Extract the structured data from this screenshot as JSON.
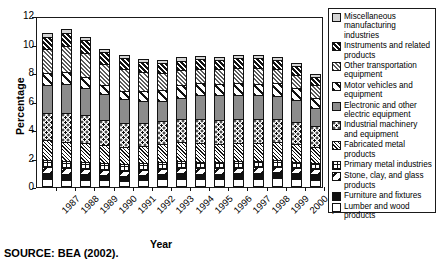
{
  "figure": {
    "source_note": "SOURCE: BEA (2002)."
  },
  "chart_data": {
    "type": "bar",
    "subtype": "stacked-bar",
    "title": "",
    "xlabel": "Year",
    "ylabel": "Percentage",
    "ylim": [
      0,
      12
    ],
    "yticks": [
      "0",
      "2",
      "4",
      "6",
      "8",
      "10",
      "12"
    ],
    "grid": false,
    "legend_position": "right",
    "categories": [
      "1987",
      "1988",
      "1989",
      "1990",
      "1991",
      "1992",
      "1993",
      "1994",
      "1995",
      "1996",
      "1997",
      "1998",
      "1999",
      "2000",
      "2001"
    ],
    "series": [
      {
        "name": "Lumber and wood products",
        "pattern": "white",
        "values": [
          0.55,
          0.52,
          0.5,
          0.47,
          0.45,
          0.5,
          0.54,
          0.57,
          0.54,
          0.55,
          0.56,
          0.58,
          0.6,
          0.55,
          0.52
        ]
      },
      {
        "name": "Furniture and fixtures",
        "pattern": "solid-black",
        "values": [
          0.4,
          0.39,
          0.38,
          0.36,
          0.35,
          0.36,
          0.38,
          0.4,
          0.39,
          0.39,
          0.4,
          0.41,
          0.42,
          0.4,
          0.38
        ]
      },
      {
        "name": "Stone, clay, and glass products",
        "pattern": "backslash",
        "values": [
          0.42,
          0.4,
          0.39,
          0.37,
          0.35,
          0.35,
          0.36,
          0.38,
          0.37,
          0.37,
          0.38,
          0.39,
          0.4,
          0.38,
          0.36
        ]
      },
      {
        "name": "Primary metal industries",
        "pattern": "grid",
        "values": [
          0.55,
          0.54,
          0.52,
          0.5,
          0.47,
          0.46,
          0.47,
          0.48,
          0.48,
          0.47,
          0.47,
          0.46,
          0.45,
          0.44,
          0.4
        ]
      },
      {
        "name": "Fabricated metal products",
        "pattern": "fine-diagonal",
        "values": [
          1.35,
          1.32,
          1.28,
          1.22,
          1.2,
          1.22,
          1.25,
          1.3,
          1.28,
          1.27,
          1.28,
          1.28,
          1.27,
          1.22,
          1.15
        ]
      },
      {
        "name": "Industrial machinery and equipment",
        "pattern": "dots",
        "values": [
          1.95,
          2.05,
          1.95,
          1.8,
          1.65,
          1.6,
          1.6,
          1.65,
          1.7,
          1.65,
          1.65,
          1.63,
          1.6,
          1.55,
          1.45
        ]
      },
      {
        "name": "Electronic and other electric equipment",
        "pattern": "solid-gray",
        "values": [
          1.95,
          2.0,
          1.95,
          1.8,
          1.7,
          1.55,
          1.45,
          1.5,
          1.72,
          1.75,
          1.75,
          1.7,
          1.65,
          1.6,
          1.3
        ]
      },
      {
        "name": "Motor vehicles and equipment",
        "pattern": "white-bold-diagonal",
        "values": [
          0.8,
          0.85,
          0.72,
          0.62,
          0.6,
          0.68,
          0.78,
          0.88,
          0.82,
          0.8,
          0.82,
          0.8,
          0.88,
          0.82,
          0.7
        ]
      },
      {
        "name": "Other transportation equipment",
        "pattern": "gray-diagonal",
        "values": [
          1.7,
          1.8,
          1.72,
          1.52,
          1.5,
          1.35,
          1.2,
          1.05,
          1.0,
          1.0,
          1.05,
          1.1,
          1.0,
          0.9,
          0.88
        ]
      },
      {
        "name": "Instruments and related products",
        "pattern": "black-diagonal",
        "values": [
          0.88,
          0.95,
          0.88,
          0.82,
          0.78,
          0.72,
          0.68,
          0.65,
          0.66,
          0.66,
          0.68,
          0.68,
          0.66,
          0.62,
          0.6
        ]
      },
      {
        "name": "Miscellaneous manufacturing industries",
        "pattern": "light-gray",
        "values": [
          0.25,
          0.26,
          0.25,
          0.24,
          0.22,
          0.22,
          0.22,
          0.23,
          0.23,
          0.23,
          0.23,
          0.23,
          0.22,
          0.21,
          0.2
        ]
      }
    ],
    "totals": [
      10.8,
      11.08,
      10.54,
      9.72,
      9.27,
      9.01,
      8.93,
      9.09,
      9.19,
      9.14,
      9.27,
      9.26,
      9.15,
      8.69,
      7.94
    ]
  },
  "legend": {
    "items": [
      {
        "label": "Miscellaneous manufacturing industries",
        "pattern": "light-gray"
      },
      {
        "label": "Instruments and related products",
        "pattern": "black-diagonal"
      },
      {
        "label": "Other transportation equipment",
        "pattern": "gray-diagonal"
      },
      {
        "label": "Motor vehicles and equipment",
        "pattern": "white-bold-diagonal"
      },
      {
        "label": "Electronic and other electric equipment",
        "pattern": "solid-gray"
      },
      {
        "label": "Industrial machinery and equipment",
        "pattern": "dots"
      },
      {
        "label": "Fabricated metal products",
        "pattern": "fine-diagonal"
      },
      {
        "label": "Primary metal industries",
        "pattern": "grid"
      },
      {
        "label": "Stone, clay, and glass products",
        "pattern": "backslash"
      },
      {
        "label": "Furniture and fixtures",
        "pattern": "solid-black"
      },
      {
        "label": "Lumber and wood products",
        "pattern": "white"
      }
    ]
  }
}
